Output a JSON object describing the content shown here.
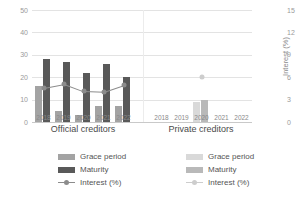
{
  "chart_data": {
    "type": "bar",
    "title": "",
    "categories": [
      "2018",
      "2019",
      "2020",
      "2021",
      "2022"
    ],
    "panels": [
      {
        "name": "Official creditors",
        "series": [
          {
            "name": "Grace period",
            "values": [
              16,
              5,
              3,
              7,
              7
            ],
            "color": "#a3a3a3"
          },
          {
            "name": "Maturity",
            "values": [
              28,
              27,
              22,
              26,
              20
            ],
            "color": "#595959"
          },
          {
            "name": "Interest (%)",
            "values": [
              4.6,
              5.1,
              4.1,
              4.0,
              4.9
            ],
            "color": "#8c8c8c",
            "axis": "right"
          }
        ]
      },
      {
        "name": "Private creditors",
        "series": [
          {
            "name": "Grace period",
            "values": [
              null,
              null,
              9,
              null,
              null
            ],
            "color": "#d9d9d9"
          },
          {
            "name": "Maturity",
            "values": [
              null,
              null,
              10,
              null,
              null
            ],
            "color": "#b9b9b9"
          },
          {
            "name": "Interest (%)",
            "values": [
              null,
              null,
              6.0,
              null,
              null
            ],
            "color": "#cdcdcd",
            "axis": "right"
          }
        ]
      }
    ],
    "left_axis": {
      "label": "Years",
      "ticks": [
        "0",
        "10",
        "20",
        "30",
        "40",
        "50"
      ],
      "min": 0,
      "max": 50
    },
    "right_axis": {
      "label": "Interest (%)",
      "ticks": [
        "0",
        "3",
        "6",
        "9",
        "12",
        "15"
      ],
      "min": 0,
      "max": 15
    },
    "grid": true,
    "legend_position": "bottom"
  },
  "legends": {
    "official": {
      "grace": "Grace period",
      "maturity": "Maturity",
      "interest": "Interest (%)"
    },
    "private": {
      "grace": "Grace period",
      "maturity": "Maturity",
      "interest": "Interest (%)"
    }
  },
  "colors": {
    "official_grace": "#a3a3a3",
    "official_maturity": "#595959",
    "official_line": "#8c8c8c",
    "private_grace": "#d9d9d9",
    "private_maturity": "#b9b9b9",
    "private_line": "#cdcdcd",
    "grid": "#e3e3e3",
    "tick_text": "#9a9a9a"
  }
}
